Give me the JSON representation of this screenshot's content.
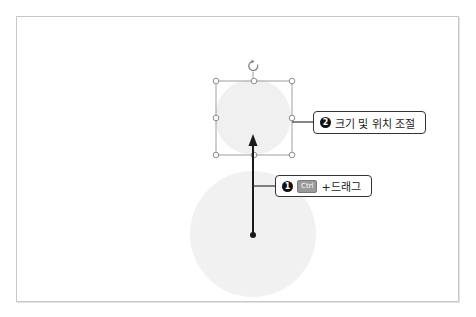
{
  "caption": "",
  "slide": {
    "shapes": {
      "large_circle": {
        "cx": 253,
        "cy": 234,
        "r": 63,
        "color": "#f1f1f1"
      },
      "small_circle": {
        "cx": 253,
        "cy": 117,
        "r": 38,
        "color": "#f1f1f1"
      }
    },
    "selection_box": {
      "x": 216,
      "y": 81,
      "w": 76,
      "h": 74,
      "color": "#9a9a9a"
    },
    "drag_arrow": {
      "x": 253,
      "y_start": 235,
      "y_end": 136,
      "color": "#1a1a1a"
    }
  },
  "callouts": [
    {
      "number": "1",
      "key": "Ctrl",
      "text": "+드래그"
    },
    {
      "number": "2",
      "text": "크기 및 위치 조절"
    }
  ]
}
